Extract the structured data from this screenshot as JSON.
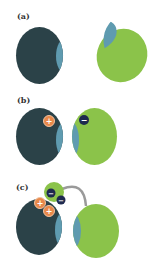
{
  "panels": [
    {
      "label": "(a)"
    },
    {
      "label": "(b)",
      "charges": [
        "+",
        "−"
      ]
    },
    {
      "label": "(c)",
      "charges": [
        "+",
        "+",
        "−",
        "−"
      ]
    }
  ],
  "colors": {
    "dark_cell": "#2b4248",
    "green_cell": "#8bc34a",
    "blue_patch": "#5f9bb0",
    "plus_fill": "#e8894a",
    "minus_fill": "#1f2a4f",
    "arc": "#9a9a9a"
  }
}
